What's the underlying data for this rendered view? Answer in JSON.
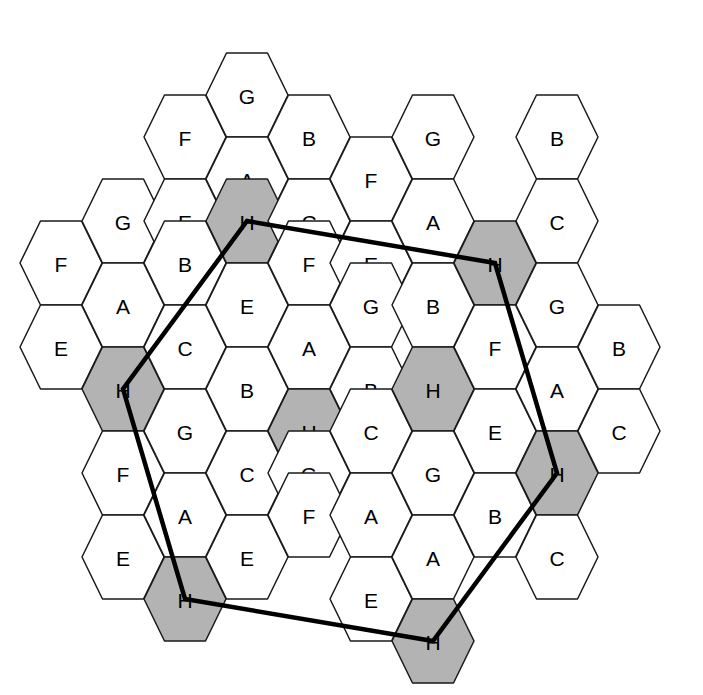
{
  "diagram": {
    "canvas": {
      "width": 703,
      "height": 695
    },
    "background_color": "#ffffff",
    "cell_fill_plain": "#ffffff",
    "cell_fill_shaded": "#b3b3b3",
    "cell_stroke_color": "#1a1a1a",
    "route_color": "#000000",
    "shaded_label": "H",
    "geometry": {
      "orientation": "flat-top",
      "cell_width": 82,
      "cell_height": 84,
      "column_step_x": 62,
      "column_offset_y": 42,
      "row_step_y": 84
    }
  },
  "legend": {
    "labels_used": [
      "A",
      "B",
      "C",
      "D",
      "E",
      "F",
      "G",
      "H"
    ],
    "letters_present": [
      "A",
      "B",
      "C",
      "E",
      "F",
      "G",
      "H"
    ]
  },
  "columns": [
    {
      "index": 0,
      "cx": 61,
      "cells": [
        {
          "label": "F",
          "cy": 263,
          "shaded": false
        },
        {
          "label": "E",
          "cy": 347,
          "shaded": false
        }
      ]
    },
    {
      "index": 1,
      "cx": 123,
      "cells": [
        {
          "label": "G",
          "cy": 221,
          "shaded": false
        },
        {
          "label": "A",
          "cy": 305,
          "shaded": false
        },
        {
          "label": "H",
          "cy": 389,
          "shaded": true
        },
        {
          "label": "F",
          "cy": 473,
          "shaded": false
        },
        {
          "label": "E",
          "cy": 557,
          "shaded": false
        }
      ]
    },
    {
      "index": 2,
      "cx": 185,
      "cells": [
        {
          "label": "F",
          "cy": 137,
          "shaded": false
        },
        {
          "label": "E",
          "cy": 221,
          "shaded": false
        },
        {
          "label": "B",
          "cy": 263,
          "shaded": false
        },
        {
          "label": "C",
          "cy": 347,
          "shaded": false
        },
        {
          "label": "G",
          "cy": 431,
          "shaded": false
        },
        {
          "label": "A",
          "cy": 515,
          "shaded": false
        },
        {
          "label": "H",
          "cy": 599,
          "shaded": true
        }
      ]
    },
    {
      "index": 3,
      "cx": 247,
      "cells": [
        {
          "label": "G",
          "cy": 95,
          "shaded": false
        },
        {
          "label": "A",
          "cy": 179,
          "shaded": false
        },
        {
          "label": "H",
          "cy": 221,
          "shaded": true
        },
        {
          "label": "E",
          "cy": 305,
          "shaded": false
        },
        {
          "label": "B",
          "cy": 389,
          "shaded": false
        },
        {
          "label": "C",
          "cy": 473,
          "shaded": false
        },
        {
          "label": "E",
          "cy": 557,
          "shaded": false
        }
      ]
    },
    {
      "index": 4,
      "cx": 309,
      "cells": [
        {
          "label": "B",
          "cy": 137,
          "shaded": false
        },
        {
          "label": "C",
          "cy": 221,
          "shaded": false
        },
        {
          "label": "F",
          "cy": 263,
          "shaded": false
        },
        {
          "label": "A",
          "cy": 347,
          "shaded": false
        },
        {
          "label": "H",
          "cy": 431,
          "shaded": true
        },
        {
          "label": "G",
          "cy": 473,
          "shaded": false
        },
        {
          "label": "F",
          "cy": 515,
          "shaded": false
        }
      ]
    },
    {
      "index": 5,
      "cx": 371,
      "cells": [
        {
          "label": "F",
          "cy": 179,
          "shaded": false
        },
        {
          "label": "E",
          "cy": 263,
          "shaded": false
        },
        {
          "label": "G",
          "cy": 305,
          "shaded": false
        },
        {
          "label": "B",
          "cy": 389,
          "shaded": false
        },
        {
          "label": "C",
          "cy": 431,
          "shaded": false
        },
        {
          "label": "A",
          "cy": 515,
          "shaded": false
        },
        {
          "label": "E",
          "cy": 599,
          "shaded": false
        }
      ]
    },
    {
      "index": 6,
      "cx": 433,
      "cells": [
        {
          "label": "G",
          "cy": 137,
          "shaded": false
        },
        {
          "label": "A",
          "cy": 221,
          "shaded": false
        },
        {
          "label": "B",
          "cy": 305,
          "shaded": false
        },
        {
          "label": "H",
          "cy": 389,
          "shaded": true
        },
        {
          "label": "G",
          "cy": 473,
          "shaded": false
        },
        {
          "label": "A",
          "cy": 557,
          "shaded": false
        },
        {
          "label": "H",
          "cy": 641,
          "shaded": true
        }
      ]
    },
    {
      "index": 7,
      "cx": 495,
      "cells": [
        {
          "label": "H",
          "cy": 263,
          "shaded": true
        },
        {
          "label": "F",
          "cy": 347,
          "shaded": false
        },
        {
          "label": "E",
          "cy": 431,
          "shaded": false
        },
        {
          "label": "B",
          "cy": 515,
          "shaded": false
        }
      ]
    },
    {
      "index": 8,
      "cx": 557,
      "cells": [
        {
          "label": "B",
          "cy": 137,
          "shaded": false
        },
        {
          "label": "C",
          "cy": 221,
          "shaded": false
        },
        {
          "label": "G",
          "cy": 305,
          "shaded": false
        },
        {
          "label": "A",
          "cy": 389,
          "shaded": false
        },
        {
          "label": "H",
          "cy": 473,
          "shaded": true
        },
        {
          "label": "C",
          "cy": 557,
          "shaded": false
        }
      ]
    },
    {
      "index": 9,
      "cx": 619,
      "cells": [
        {
          "label": "B",
          "cy": 347,
          "shaded": false
        },
        {
          "label": "C",
          "cy": 431,
          "shaded": false
        }
      ]
    }
  ],
  "route": {
    "name": "closed-route-polygon",
    "closed": true,
    "stroke_width": 4.5,
    "vertex_labels": [
      "H",
      "H",
      "H",
      "H",
      "H",
      "H"
    ],
    "vertices": [
      {
        "label": "H",
        "x": 247,
        "y": 221
      },
      {
        "label": "H",
        "x": 495,
        "y": 263
      },
      {
        "label": "H",
        "x": 557,
        "y": 473
      },
      {
        "label": "H",
        "x": 433,
        "y": 641
      },
      {
        "label": "H",
        "x": 185,
        "y": 599
      },
      {
        "label": "H",
        "x": 123,
        "y": 389
      }
    ]
  }
}
